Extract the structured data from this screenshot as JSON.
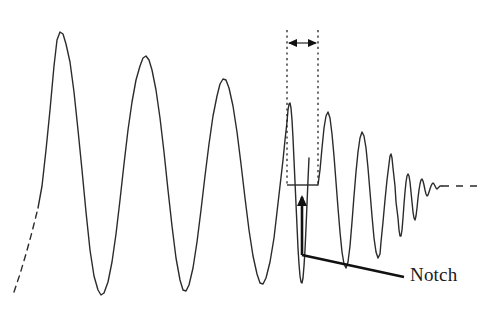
{
  "figure": {
    "background_color": "#ffffff",
    "trace_color": "#2b2b2b",
    "annotation_color": "#111111",
    "width": 486,
    "height": 312
  },
  "annotations": {
    "notch_label": "Notch"
  },
  "chart_data": {
    "type": "line",
    "title": "",
    "xlabel": "",
    "ylabel": "",
    "grid": false,
    "legend": null,
    "xlim": [
      0,
      486
    ],
    "ylim": [
      312,
      0
    ],
    "baseline_y": 186,
    "notch": {
      "label": "Notch",
      "flat_segment": {
        "x_start": 287,
        "x_end": 318,
        "y": 185
      },
      "span_markers_x": [
        287,
        318
      ],
      "span_arrow_y": 43,
      "dotted_line_top_y": 30,
      "dotted_line_bottom_y": 186,
      "callout": {
        "arrow_tip": [
          302,
          197
        ],
        "elbow": [
          302,
          255
        ],
        "text_anchor": [
          404,
          277
        ]
      }
    },
    "segments": [
      {
        "name": "lead-in-dashed",
        "style": "dashed",
        "points": [
          [
            14,
            292
          ],
          [
            20,
            274
          ],
          [
            26,
            254
          ],
          [
            32,
            232
          ],
          [
            38,
            208
          ]
        ]
      },
      {
        "name": "main-oscillation",
        "style": "solid",
        "points": [
          [
            38,
            208
          ],
          [
            42,
            186
          ],
          [
            46,
            150
          ],
          [
            50,
            110
          ],
          [
            54,
            66
          ],
          [
            57,
            40
          ],
          [
            60,
            32
          ],
          [
            63,
            34
          ],
          [
            66,
            44
          ],
          [
            70,
            62
          ],
          [
            74,
            92
          ],
          [
            78,
            130
          ],
          [
            82,
            170
          ],
          [
            86,
            212
          ],
          [
            90,
            250
          ],
          [
            94,
            276
          ],
          [
            98,
            290
          ],
          [
            101,
            295
          ],
          [
            104,
            293
          ],
          [
            108,
            282
          ],
          [
            112,
            262
          ],
          [
            116,
            234
          ],
          [
            120,
            200
          ],
          [
            124,
            164
          ],
          [
            128,
            130
          ],
          [
            132,
            102
          ],
          [
            136,
            80
          ],
          [
            140,
            66
          ],
          [
            143,
            58
          ],
          [
            146,
            56
          ],
          [
            149,
            60
          ],
          [
            152,
            70
          ],
          [
            156,
            90
          ],
          [
            160,
            118
          ],
          [
            164,
            152
          ],
          [
            168,
            190
          ],
          [
            172,
            226
          ],
          [
            176,
            258
          ],
          [
            180,
            280
          ],
          [
            183,
            290
          ],
          [
            186,
            291
          ],
          [
            189,
            285
          ],
          [
            193,
            268
          ],
          [
            197,
            242
          ],
          [
            201,
            210
          ],
          [
            205,
            176
          ],
          [
            209,
            144
          ],
          [
            213,
            116
          ],
          [
            217,
            96
          ],
          [
            220,
            84
          ],
          [
            223,
            79
          ],
          [
            226,
            80
          ],
          [
            229,
            88
          ],
          [
            233,
            106
          ],
          [
            237,
            132
          ],
          [
            241,
            164
          ],
          [
            245,
            198
          ],
          [
            249,
            230
          ],
          [
            253,
            256
          ],
          [
            257,
            274
          ],
          [
            260,
            283
          ],
          [
            263,
            284
          ],
          [
            266,
            278
          ],
          [
            270,
            262
          ],
          [
            274,
            238
          ],
          [
            277,
            212
          ],
          [
            280,
            186
          ],
          [
            283,
            160
          ],
          [
            285,
            140
          ],
          [
            287,
            122
          ],
          [
            288,
            110
          ],
          [
            289,
            104
          ],
          [
            290,
            103
          ],
          [
            291,
            108
          ],
          [
            292,
            120
          ],
          [
            293,
            138
          ],
          [
            294,
            160
          ],
          [
            295,
            182
          ],
          [
            296,
            204
          ],
          [
            297,
            226
          ],
          [
            298,
            248
          ],
          [
            299,
            264
          ],
          [
            300,
            276
          ],
          [
            301,
            282
          ],
          [
            302,
            283
          ],
          [
            303,
            278
          ],
          [
            304,
            266
          ],
          [
            305,
            250
          ],
          [
            306,
            228
          ],
          [
            307,
            204
          ],
          [
            308,
            180
          ],
          [
            309,
            158
          ]
        ]
      },
      {
        "name": "notch-flat",
        "style": "solid",
        "points": [
          [
            287,
            185
          ],
          [
            318,
            185
          ]
        ]
      },
      {
        "name": "post-notch-ringdown",
        "style": "solid",
        "points": [
          [
            318,
            185
          ],
          [
            320,
            170
          ],
          [
            322,
            148
          ],
          [
            324,
            128
          ],
          [
            326,
            116
          ],
          [
            328,
            112
          ],
          [
            330,
            118
          ],
          [
            332,
            134
          ],
          [
            334,
            156
          ],
          [
            336,
            182
          ],
          [
            338,
            208
          ],
          [
            340,
            232
          ],
          [
            342,
            252
          ],
          [
            344,
            264
          ],
          [
            346,
            268
          ],
          [
            348,
            262
          ],
          [
            350,
            246
          ],
          [
            352,
            222
          ],
          [
            354,
            196
          ],
          [
            356,
            172
          ],
          [
            358,
            152
          ],
          [
            360,
            138
          ],
          [
            362,
            132
          ],
          [
            364,
            136
          ],
          [
            366,
            148
          ],
          [
            368,
            168
          ],
          [
            370,
            192
          ],
          [
            372,
            216
          ],
          [
            374,
            238
          ],
          [
            376,
            252
          ],
          [
            378,
            258
          ],
          [
            380,
            254
          ],
          [
            381,
            242
          ],
          [
            383,
            222
          ],
          [
            385,
            200
          ],
          [
            387,
            180
          ],
          [
            389,
            164
          ],
          [
            390,
            156
          ],
          [
            391,
            154
          ],
          [
            392,
            158
          ],
          [
            393,
            168
          ],
          [
            395,
            186
          ],
          [
            396,
            202
          ],
          [
            398,
            218
          ],
          [
            399,
            230
          ],
          [
            400,
            236
          ],
          [
            401,
            236
          ],
          [
            402,
            230
          ],
          [
            403,
            218
          ],
          [
            404,
            204
          ],
          [
            405,
            192
          ],
          [
            406,
            182
          ],
          [
            407,
            176
          ],
          [
            408,
            174
          ],
          [
            409,
            176
          ],
          [
            410,
            182
          ],
          [
            411,
            192
          ],
          [
            412,
            202
          ],
          [
            413,
            212
          ],
          [
            414,
            218
          ],
          [
            415,
            220
          ],
          [
            416,
            216
          ],
          [
            417,
            208
          ],
          [
            418,
            198
          ],
          [
            419,
            190
          ],
          [
            420,
            184
          ],
          [
            421,
            180
          ],
          [
            422,
            179
          ],
          [
            423,
            181
          ],
          [
            424,
            185
          ],
          [
            425,
            190
          ],
          [
            426,
            194
          ],
          [
            427,
            196
          ],
          [
            428,
            195
          ],
          [
            429,
            192
          ],
          [
            430,
            189
          ],
          [
            431,
            186
          ],
          [
            432,
            184
          ],
          [
            433,
            183
          ],
          [
            434,
            184
          ],
          [
            435,
            186
          ],
          [
            436,
            188
          ],
          [
            437,
            189
          ],
          [
            438,
            188
          ],
          [
            439,
            187
          ],
          [
            440,
            186
          ],
          [
            441,
            186
          ],
          [
            442,
            186
          ]
        ]
      },
      {
        "name": "tail-dashed",
        "style": "dashed",
        "points": [
          [
            442,
            186
          ],
          [
            478,
            186
          ]
        ]
      }
    ]
  }
}
